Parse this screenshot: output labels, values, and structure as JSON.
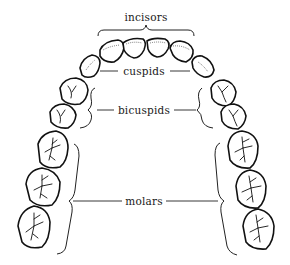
{
  "diagram": {
    "labels": {
      "incisors": "incisors",
      "cuspids": "cuspids",
      "bicuspids": "bicuspids",
      "molars": "molars"
    },
    "tooth_groups": [
      {
        "name": "incisors",
        "count": 4
      },
      {
        "name": "cuspids",
        "count": 2
      },
      {
        "name": "bicuspids",
        "count": 4
      },
      {
        "name": "molars",
        "count": 6
      }
    ],
    "colors": {
      "line": "#111111",
      "background": "#ffffff"
    }
  }
}
